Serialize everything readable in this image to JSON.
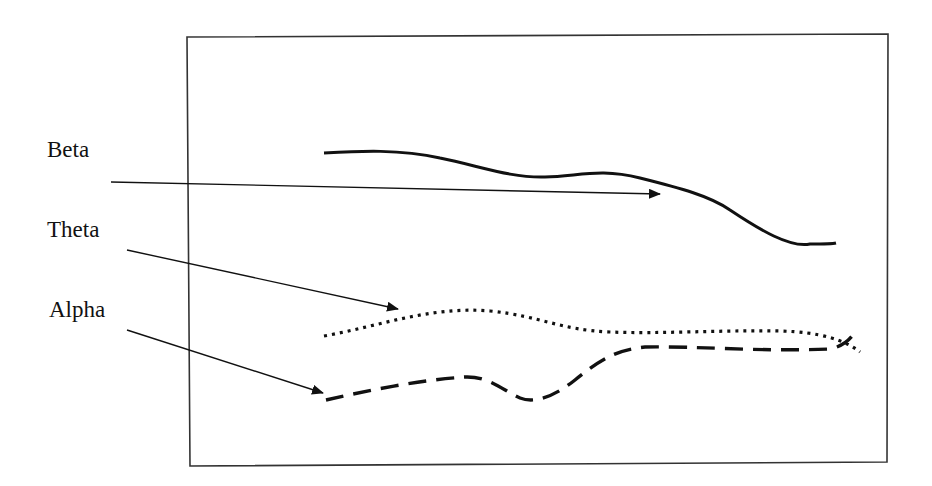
{
  "diagram": {
    "type": "labeled curve diagram",
    "labels": [
      {
        "id": "beta",
        "text": "Beta",
        "line_style": "solid"
      },
      {
        "id": "theta",
        "text": "Theta",
        "line_style": "dotted"
      },
      {
        "id": "alpha",
        "text": "Alpha",
        "line_style": "dashed"
      }
    ],
    "colors": {
      "stroke": "#111111",
      "frame": "#333333",
      "background": "#ffffff"
    }
  }
}
